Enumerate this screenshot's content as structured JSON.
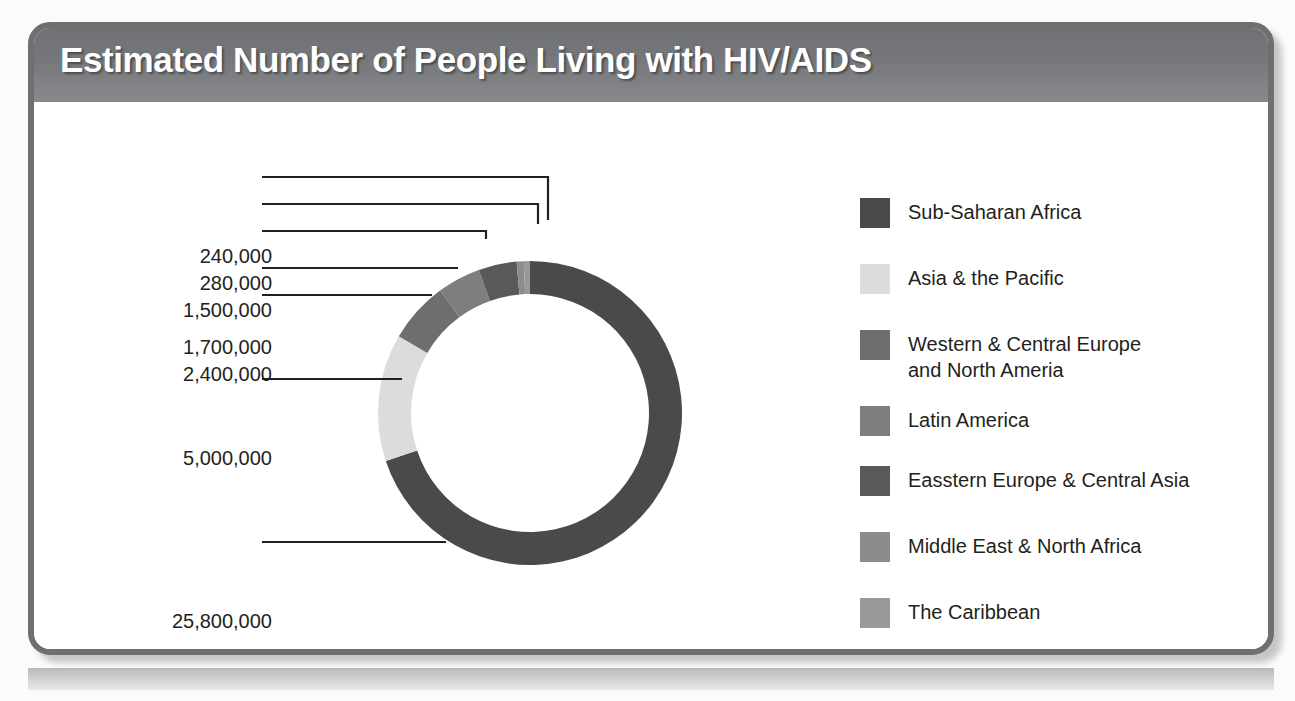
{
  "header": {
    "title": "Estimated Number of People Living with HIV/AIDS"
  },
  "source": {
    "text": "Source: Avert, 2014"
  },
  "colors": {
    "card_border": "#6e6f71",
    "header_gradient_start": "#6f7073",
    "header_gradient_end": "#88898c",
    "label_text": "#231f20",
    "leader_line": "#231f20"
  },
  "legend": {
    "items": [
      {
        "label": "Sub-Saharan Africa",
        "color": "#4a4a4c"
      },
      {
        "label": "Asia & the Pacific",
        "color": "#dcdcdc"
      },
      {
        "label": "Western & Central Europe\nand North Ameria",
        "color": "#6d6e70"
      },
      {
        "label": "Latin America",
        "color": "#7d7e80"
      },
      {
        "label": "Easstern Europe & Central Asia",
        "color": "#58595b"
      },
      {
        "label": "Middle East & North Africa",
        "color": "#8b8c8e"
      },
      {
        "label": "The Caribbean",
        "color": "#97999b"
      }
    ]
  },
  "chart_data": {
    "type": "pie",
    "title": "Estimated Number of People Living with HIV/AIDS",
    "subtitle": "",
    "xlabel": "",
    "ylabel": "",
    "donut": true,
    "legend_position": "right",
    "grid": false,
    "categories": [
      "Sub-Saharan Africa",
      "Asia & the Pacific",
      "Western & Central Europe and North Ameria",
      "Latin America",
      "Easstern Europe & Central Asia",
      "Middle East & North Africa",
      "The Caribbean"
    ],
    "values": [
      25800000,
      5000000,
      2400000,
      1700000,
      1500000,
      280000,
      240000
    ],
    "value_labels": [
      "25,800,000",
      "5,000,000",
      "2,400,000",
      "1,700,000",
      "1,500,000",
      "280,000",
      "240,000"
    ],
    "colors": [
      "#4a4a4c",
      "#dcdcdc",
      "#6d6e70",
      "#7d7e80",
      "#58595b",
      "#8b8c8e",
      "#97999b"
    ],
    "total": 36920000,
    "annotations": [
      "Source: Avert, 2014"
    ]
  },
  "value_labels": [
    {
      "text": "240,000",
      "right": 250,
      "top": 143
    },
    {
      "text": "280,000",
      "right": 250,
      "top": 170
    },
    {
      "text": "1,500,000",
      "right": 250,
      "top": 197
    },
    {
      "text": "1,700,000",
      "right": 250,
      "top": 234
    },
    {
      "text": "2,400,000",
      "right": 250,
      "top": 261
    },
    {
      "text": "5,000,000",
      "right": 250,
      "top": 345
    },
    {
      "text": "25,800,000",
      "right": 250,
      "top": 508
    }
  ]
}
